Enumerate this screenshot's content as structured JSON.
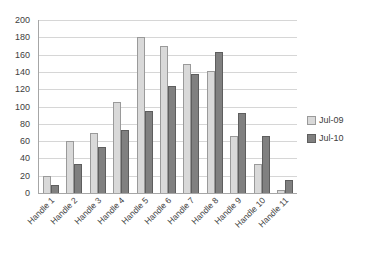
{
  "chart_data": {
    "type": "bar",
    "title": "",
    "subtitle": "",
    "xlabel": "",
    "ylabel": "",
    "ylim": [
      0,
      200
    ],
    "yticks": [
      0,
      20,
      40,
      60,
      80,
      100,
      120,
      140,
      160,
      180,
      200
    ],
    "grid": true,
    "legend_position": "right",
    "categories": [
      "Handle 1",
      "Handle 2",
      "Handle 3",
      "Handle 4",
      "Handle 5",
      "Handle 6",
      "Handle 7",
      "Handle 8",
      "Handle 9",
      "Handle 10",
      "Handle 11"
    ],
    "series": [
      {
        "name": "Jul-09",
        "color": "#D9D9D9",
        "values": [
          20,
          60,
          69,
          105,
          180,
          170,
          149,
          141,
          66,
          34,
          3
        ]
      },
      {
        "name": "Jul-10",
        "color": "#808080",
        "values": [
          9,
          33,
          53,
          73,
          95,
          124,
          138,
          163,
          93,
          66,
          15
        ]
      }
    ]
  },
  "legend": {
    "items": [
      {
        "label": "Jul-09"
      },
      {
        "label": "Jul-10"
      }
    ]
  },
  "axis": {
    "y_max_label": "200",
    "y_min_label": "0"
  }
}
